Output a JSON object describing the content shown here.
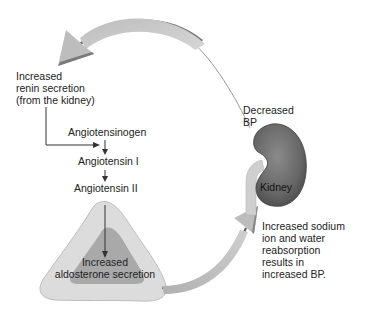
{
  "diagram": {
    "type": "renin-angiotensin-aldosterone feedback loop",
    "nodes": {
      "renin": {
        "lines": [
          "Increased",
          "renin secretion",
          "(from the kidney)"
        ]
      },
      "angiotensinogen": {
        "label": "Angiotensinogen"
      },
      "angiotensin1": {
        "label": "Angiotensin I"
      },
      "angiotensin2": {
        "label": "Angiotensin II"
      },
      "aldosterone": {
        "lines": [
          "Increased",
          "aldosterone secretion"
        ]
      },
      "decreased_bp": {
        "lines": [
          "Decreased",
          "BP"
        ]
      },
      "kidney": {
        "label": "Kidney"
      },
      "outcome": {
        "lines": [
          "Increased sodium",
          "ion and water",
          "reabsorption",
          "results in",
          "increased BP."
        ]
      }
    },
    "edges": [
      {
        "from": "kidney",
        "to": "renin",
        "style": "large curved gray arrow"
      },
      {
        "from": "renin",
        "to": "angiotensinogen",
        "style": "thin elbow arrow"
      },
      {
        "from": "angiotensinogen",
        "to": "angiotensin1",
        "style": "thin arrow"
      },
      {
        "from": "angiotensin1",
        "to": "angiotensin2",
        "style": "thin arrow"
      },
      {
        "from": "angiotensin2",
        "to": "aldosterone",
        "style": "thin arrow into adrenal gland"
      },
      {
        "from": "aldosterone",
        "to": "kidney",
        "style": "large curved gray arrow"
      }
    ],
    "colors": {
      "arrow_fill": "#c4c4c4",
      "arrow_shadow": "#7a7a7a",
      "kidney_fill": "#6e6e6e",
      "kidney_dark": "#4a4a4a",
      "adrenal_outer": "#d9d9d9",
      "adrenal_inner": "#a8a8a8",
      "line": "#333333"
    }
  }
}
